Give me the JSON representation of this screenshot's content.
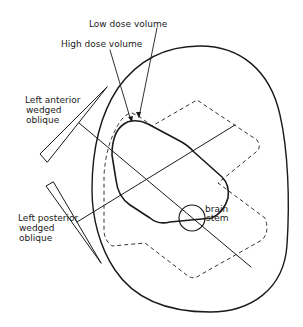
{
  "figure": {
    "type": "radiotherapy beam arrangement diagram",
    "labels": {
      "low_dose": "Low dose volume",
      "high_dose": "High dose volume",
      "anterior_line1": "Left anterior",
      "anterior_line2": "wedged",
      "anterior_line3": "oblique",
      "posterior_line1": "Left posterior",
      "posterior_line2": "wedged",
      "posterior_line3": "oblique",
      "brain_line1": "brain",
      "brain_line2": "stem"
    },
    "colors": {
      "line": "#1a1a1a",
      "background": "#ffffff"
    }
  }
}
